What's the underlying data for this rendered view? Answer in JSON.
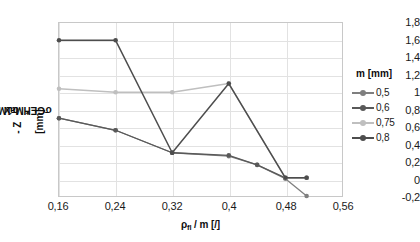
{
  "chart_data": {
    "type": "line",
    "title": "",
    "xlabel": "ρfl / m [/]",
    "ylabel": "Zσ1Max* - ZσGEHMax [mm]",
    "xlim": [
      0.16,
      0.56
    ],
    "ylim": [
      -0.2,
      1.8
    ],
    "grid": true,
    "legend_position": "right",
    "legend_title": "m [mm]",
    "x_ticks": [
      "0,16",
      "0,24",
      "0,32",
      "0,4",
      "0,48",
      "0,56"
    ],
    "x_tick_values": [
      0.16,
      0.24,
      0.32,
      0.4,
      0.48,
      0.56
    ],
    "y_ticks": [
      "-0,2",
      "0",
      "0,2",
      "0,4",
      "0,6",
      "0,8",
      "1",
      "1,2",
      "1,4",
      "1,6",
      "1,8"
    ],
    "y_tick_values": [
      -0.2,
      0,
      0.2,
      0.4,
      0.6,
      0.8,
      1.0,
      1.2,
      1.4,
      1.6,
      1.8
    ],
    "series": [
      {
        "name": "0,5",
        "color": "#7f7f7f",
        "x": [
          0.16,
          0.24,
          0.32,
          0.4,
          0.44,
          0.48,
          0.51
        ],
        "values": [
          0.7,
          0.56,
          0.3,
          0.26,
          0.16,
          0.0,
          -0.2
        ]
      },
      {
        "name": "0,6",
        "color": "#595959",
        "x": [
          0.16,
          0.24,
          0.32,
          0.4,
          0.44,
          0.48,
          0.51
        ],
        "values": [
          0.7,
          0.56,
          0.3,
          0.27,
          0.16,
          0.01,
          0.01
        ]
      },
      {
        "name": "0,75",
        "color": "#bfbfbf",
        "x": [
          0.16,
          0.24,
          0.32,
          0.4,
          0.48,
          0.51
        ],
        "values": [
          0.56,
          0.46,
          0.3,
          0.31,
          0.16,
          0.01
        ]
      },
      {
        "name": "0,8",
        "color": "#4d4d4d",
        "x": [
          0.16,
          0.24,
          0.32,
          0.4,
          0.48,
          0.51
        ],
        "values": [
          1.6,
          1.6,
          1.0,
          1.1,
          0.01,
          0.01
        ]
      }
    ],
    "series_alt": [
      {
        "name": "0,8-upper",
        "note": "dark series at top: 1,6 at 0,16 and 0,24 then steep drop to 0,3 at 0,32",
        "x": [
          0.16,
          0.24,
          0.32
        ],
        "values": [
          1.6,
          1.6,
          0.3
        ]
      },
      {
        "name": "0,75-upper",
        "note": "light-gray series near 1,0 rising to 1,1 at 0,4 then steep drop",
        "x": [
          0.16,
          0.24,
          0.32,
          0.4,
          0.48
        ],
        "values": [
          1.04,
          1.0,
          1.0,
          1.1,
          0.01
        ]
      }
    ]
  }
}
